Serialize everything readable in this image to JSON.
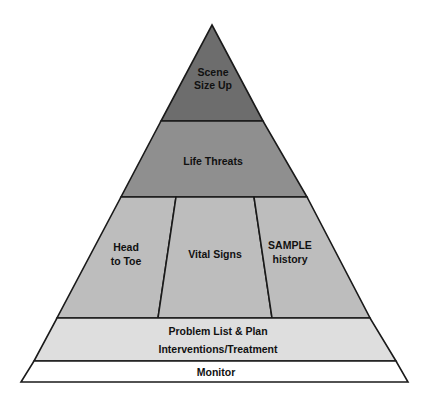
{
  "diagram": {
    "type": "pyramid",
    "top_clipped_text": "———  ————  ——————  ——————",
    "colors": {
      "scene": "#6d6d6d",
      "life": "#8f8f8f",
      "middle": "#bdbdbd",
      "problem": "#dedede",
      "monitor": "#ffffff",
      "stroke": "#1a1a1a",
      "text": "#111111"
    },
    "tiers": [
      {
        "id": "scene",
        "lines": [
          "Scene",
          "Size Up"
        ]
      },
      {
        "id": "life",
        "lines": [
          "Life Threats"
        ]
      },
      {
        "id": "middle",
        "columns": [
          {
            "id": "head",
            "lines": [
              "Head",
              "to Toe"
            ]
          },
          {
            "id": "vital",
            "lines": [
              "Vital Signs"
            ]
          },
          {
            "id": "sample",
            "lines": [
              "SAMPLE",
              "history"
            ]
          }
        ]
      },
      {
        "id": "problem",
        "lines": [
          "Problem List & Plan",
          "Interventions/Treatment"
        ]
      },
      {
        "id": "monitor",
        "lines": [
          "Monitor"
        ]
      }
    ]
  }
}
